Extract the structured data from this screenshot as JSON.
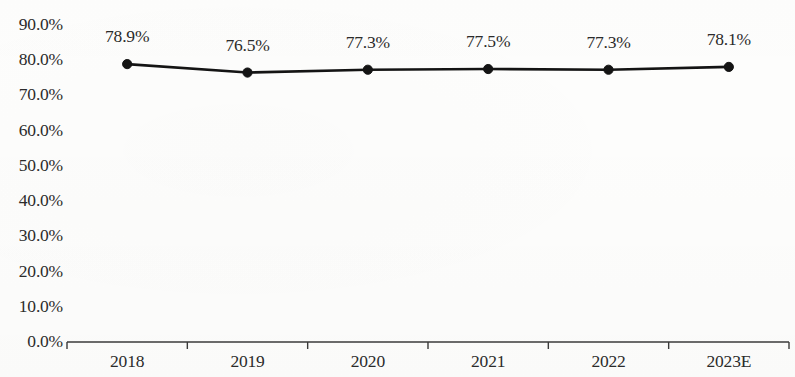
{
  "chart_data": {
    "type": "line",
    "title": "",
    "subtitle": "",
    "xlabel": "",
    "ylabel": "",
    "categories": [
      "2018",
      "2019",
      "2020",
      "2021",
      "2022",
      "2023E"
    ],
    "values": [
      78.9,
      76.5,
      77.3,
      77.5,
      77.3,
      78.1
    ],
    "point_labels": [
      "78.9%",
      "76.5%",
      "77.3%",
      "77.5%",
      "77.3%",
      "78.1%"
    ],
    "series": [
      {
        "name": "",
        "values": [
          78.9,
          76.5,
          77.3,
          77.5,
          77.3,
          78.1
        ]
      }
    ],
    "ylim": [
      0,
      90
    ],
    "y_tick_values": [
      0,
      10,
      20,
      30,
      40,
      50,
      60,
      70,
      80,
      90
    ],
    "y_tick_labels": [
      "0.0%",
      "10.0%",
      "20.0%",
      "30.0%",
      "40.0%",
      "50.0%",
      "60.0%",
      "70.0%",
      "80.0%",
      "90.0%"
    ],
    "grid": false,
    "legend": false,
    "legend_position": "none",
    "marker": "circle",
    "line_color": "#141414",
    "marker_color": "#141414",
    "text_color": "#2b2b2b",
    "axis_color": "#3a3a3a",
    "background_color": "#fdfdfc"
  }
}
